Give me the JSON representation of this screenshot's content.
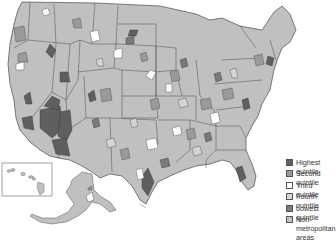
{
  "map": {
    "type": "choropleth",
    "region": "United States (metropolitan areas by quintile)",
    "insets": [
      "Hawaii",
      "Alaska"
    ]
  },
  "legend": {
    "items": [
      {
        "label": "Highest quintile",
        "color": "#5f5f5f"
      },
      {
        "label": "Second quintile",
        "color": "#9a9a9a"
      },
      {
        "label": "Third quintile",
        "color": "#ffffff"
      },
      {
        "label": "Fourth quintile",
        "color": "#d4d4d4"
      },
      {
        "label": "Lowest quintile",
        "color": "#7a7a7a"
      },
      {
        "label": "Non-metropolitan areas",
        "color": "#c0c0c0"
      }
    ]
  },
  "colors": {
    "non_metro": "#c0c0c0",
    "border": "#4a4a4a",
    "background": "#ffffff"
  }
}
